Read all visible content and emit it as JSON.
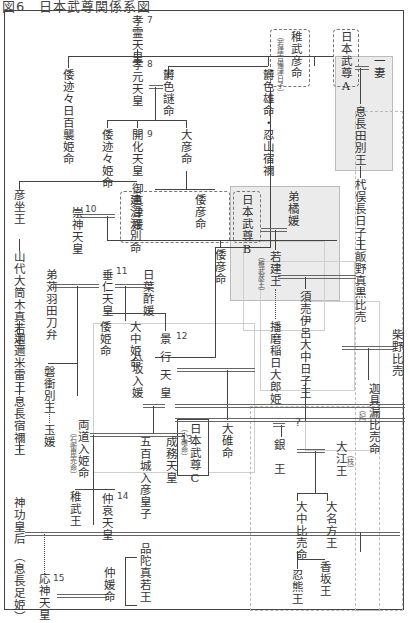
{
  "title": "図6　日本武尊関係系図",
  "nodes": {
    "korei": "孝霊天皇",
    "kogen": "孝元天皇",
    "kaika": "開化天皇",
    "sujin": "崇神天皇",
    "suinin": "垂仁天皇",
    "keiko": "景行天皇",
    "seimu": "成務天皇",
    "chuai": "仲哀天皇",
    "ojin": "応神天皇",
    "yamatototohimomoso": "倭迹々日百襲姫命",
    "yamatototohime": "倭迹々姫命",
    "ikagashikome": "欝色謎命",
    "ikagashiko": "欝色雄命・忍山宿禰",
    "ohiko": "大彦命",
    "takenunakawawake": "建沼河別命",
    "yamatohiko1": "倭彦命",
    "yamatohiko2": "倭彦命",
    "mimatsuhime": "御真津媛",
    "hikoimasu": "彦坐王",
    "yamashiro": "山代大筒木真若王",
    "kanikumetaru": "迦邇米雷王",
    "okinaga_sukune": "息長宿禰王",
    "jingu": "神功皇后",
    "jingu_note": "（息長足姫）",
    "otokarihatatobe": "弟苅羽田刀弁",
    "iwatsukuwake": "磐衝別王",
    "sorihime": "玉媛",
    "ryodo": "両道入姫命",
    "ryodo_note": "（石衝毘売命）",
    "yamatohime": "倭姫命",
    "onaka": "大中姫命",
    "hibasu": "日葉酢媛",
    "yasaka": "八坂入媛",
    "ioki": "五百城入彦皇子",
    "homuda": "品陀真若王",
    "nakatsu": "仲媛命",
    "takeshi": "稚武王",
    "wakatakehiko": "稚武彦命",
    "wakatakehiko_note": "（若建吉備津日子）",
    "yamatotakeru_a": "日本武尊A",
    "yamatotakeru_b": "日本武尊B",
    "yamatotakeru_c": "日本武尊C",
    "yamatotakeru_c_note": "（小碓命）",
    "ototachibana": "弟橘媛",
    "wakatakeru": "若建王",
    "wakatakeru_note": "（稚武彦王）",
    "harima": "播磨稲日大郎姫",
    "ousu": "大碓命",
    "ichizuma": "一妻",
    "okinagatawake": "息長田別王",
    "kuikomatsu": "杙俣長日子王",
    "iino": "飯野真黒比売",
    "sumei": "須売伊呂大中日子王",
    "shibano": "柴野比売",
    "kagutsu": "迦具漏比売命",
    "kagutsu_note": "（妃）",
    "oe": "大江王",
    "oe_note": "（枝）",
    "gin": "銀王",
    "question": "?",
    "onakatsu": "大中比売命",
    "onakata": "大名方王",
    "oshikuma": "忍熊王",
    "kagosaka": "香坂王"
  },
  "numbers": {
    "n7": "7",
    "n8": "8",
    "n9": "9",
    "n10": "10",
    "n11": "11",
    "n12": "12",
    "n13": "13",
    "n14": "14",
    "n15": "15"
  },
  "colors": {
    "grey_zone": "#ebebeb",
    "line": "#444444"
  }
}
